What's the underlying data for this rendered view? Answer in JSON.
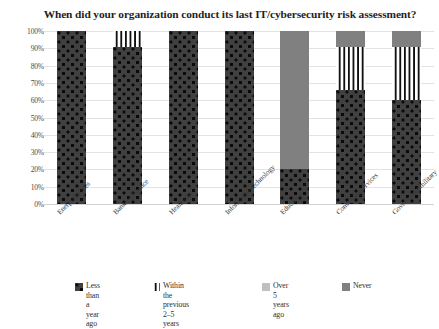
{
  "chart": {
    "title": "When did your organization conduct its last IT/cybersecurity risk assessment?"
  },
  "chart_data": {
    "type": "bar",
    "subtype": "stacked-bar-100-percent",
    "title": "When did your organization conduct its last IT/cybersecurity risk assessment?",
    "xlabel": "",
    "ylabel": "",
    "ylim": [
      0,
      100
    ],
    "yticks": [
      "0%",
      "10%",
      "20%",
      "30%",
      "40%",
      "50%",
      "60%",
      "70%",
      "80%",
      "90%",
      "100%"
    ],
    "grid": true,
    "legend_position": "bottom",
    "categories": [
      "Energy/utilities",
      "Banking/finance",
      "Healthcare",
      "Information technology",
      "Education",
      "Consulting services",
      "Government/military"
    ],
    "series": [
      {
        "name": "Less than a year ago",
        "pattern": "dots",
        "color": "#404040",
        "values": [
          100,
          91,
          100,
          100,
          20,
          66,
          60
        ]
      },
      {
        "name": "Within the previous 2–5 years",
        "pattern": "checker",
        "color": "#101010",
        "values": [
          0,
          9,
          0,
          0,
          0,
          25,
          31
        ]
      },
      {
        "name": "Over 5 years ago",
        "pattern": "solid-light-gray",
        "color": "#bfbfbf",
        "values": [
          0,
          0,
          0,
          0,
          0,
          0,
          0
        ]
      },
      {
        "name": "Never",
        "pattern": "solid-gray",
        "color": "#808080",
        "values": [
          0,
          0,
          0,
          0,
          80,
          9,
          9
        ]
      }
    ]
  },
  "legend": {
    "items": [
      {
        "label": "Less than a\nyear ago",
        "pattern": "dots"
      },
      {
        "label": "Within the previous\n2–5 years",
        "pattern": "checker"
      },
      {
        "label": "Over 5 years\nago",
        "pattern": "solid-light-gray"
      },
      {
        "label": "Never",
        "pattern": "solid-gray"
      }
    ]
  }
}
